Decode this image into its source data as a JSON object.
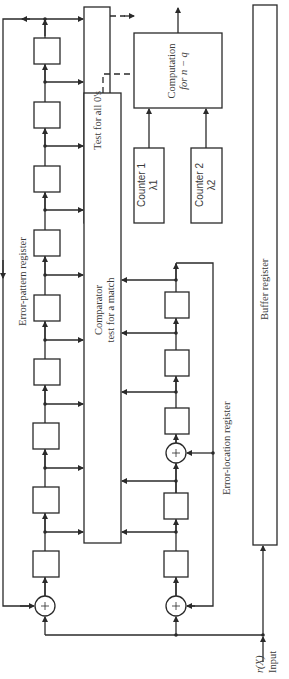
{
  "figure": {
    "labels": {
      "test_all_zeros": "Test for all 0's",
      "comparator_line1": "Comparator",
      "comparator_line2": "test for a match",
      "counter1_line1": "Counter 1",
      "counter1_line2": "λ1",
      "counter2_line1": "Counter 2",
      "counter2_line2": "λ2",
      "computation_line1": "Computation",
      "computation_line2": "for n − q",
      "error_pattern_register": "Error-pattern register",
      "error_location_register": "Error-location register",
      "buffer_register": "Buffer register",
      "input_signal": "r(X)",
      "input_label": "Input"
    },
    "error_pattern_register": {
      "cells": 8,
      "xor_gates": 1
    },
    "error_location_register": {
      "cells": 5,
      "xor_gates": 2
    },
    "colors": {
      "line": "#2a2a2a",
      "text": "#3a3a3a",
      "background": "#ffffff"
    }
  }
}
